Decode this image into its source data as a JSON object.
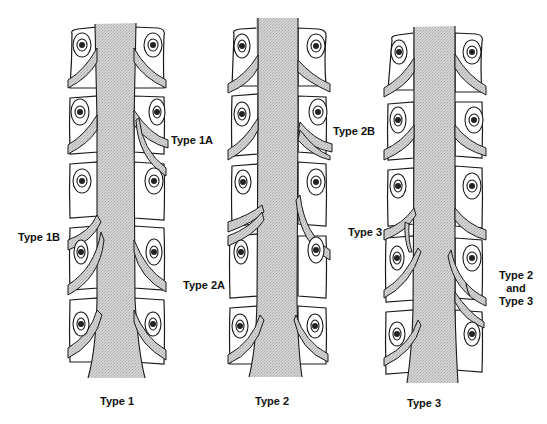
{
  "figure": {
    "panels": [
      {
        "id": "type1",
        "title": "Type 1",
        "annotations": [
          "Type 1A",
          "Type 1B"
        ]
      },
      {
        "id": "type2",
        "title": "Type 2",
        "annotations": [
          "Type 2B",
          "Type 2A"
        ]
      },
      {
        "id": "type3",
        "title": "Type 3",
        "annotations": [
          "Type 3",
          "Type 2",
          "and",
          "Type 3"
        ]
      }
    ],
    "labels": {
      "type1a": "Type 1A",
      "type1b": "Type 1B",
      "type2a": "Type 2A",
      "type2b": "Type 2B",
      "type3": "Type 3",
      "type2and3_line1": "Type 2",
      "type2and3_line2": "and",
      "type2and3_line3": "Type 3"
    },
    "colors": {
      "line": "#1a1a1a",
      "stipple": "#c8c8c8",
      "background": "#ffffff"
    }
  }
}
